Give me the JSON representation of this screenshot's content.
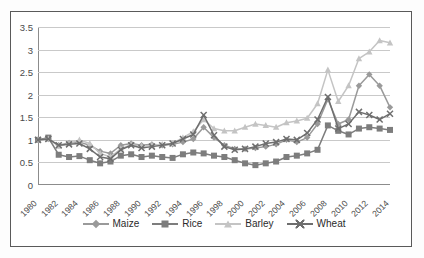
{
  "chart_data": {
    "type": "line",
    "title": "",
    "subtitle": "",
    "xlabel": "",
    "ylabel": "",
    "ylim": [
      0,
      3.5
    ],
    "xlim": [
      1980,
      2014
    ],
    "grid": true,
    "legend_position": "bottom",
    "y_ticks": [
      "0",
      "0.5",
      "1",
      "1.5",
      "2",
      "2.5",
      "3",
      "3.5"
    ],
    "y_tick_values": [
      0,
      0.5,
      1,
      1.5,
      2,
      2.5,
      3,
      3.5
    ],
    "x_tick_labels": [
      "1980",
      "1982",
      "1984",
      "1986",
      "1988",
      "1990",
      "1992",
      "1994",
      "1996",
      "1998",
      "2000",
      "2002",
      "2004",
      "2006",
      "2008",
      "2010",
      "2012",
      "2014"
    ],
    "x": [
      1980,
      1981,
      1982,
      1983,
      1984,
      1985,
      1986,
      1987,
      1988,
      1989,
      1990,
      1991,
      1992,
      1993,
      1994,
      1995,
      1996,
      1997,
      1998,
      1999,
      2000,
      2001,
      2002,
      2003,
      2004,
      2005,
      2006,
      2007,
      2008,
      2009,
      2010,
      2011,
      2012,
      2013,
      2014
    ],
    "series": [
      {
        "name": "Maize",
        "color": "#9a9a9a",
        "marker": "diamond",
        "values": [
          1.0,
          1.02,
          0.88,
          0.93,
          0.95,
          0.88,
          0.75,
          0.7,
          0.88,
          0.92,
          0.88,
          0.9,
          0.88,
          0.9,
          0.95,
          1.02,
          1.28,
          1.05,
          0.88,
          0.8,
          0.8,
          0.82,
          0.85,
          0.9,
          1.0,
          0.95,
          1.05,
          1.35,
          1.9,
          1.35,
          1.45,
          2.2,
          2.45,
          2.2,
          1.72
        ]
      },
      {
        "name": "Rice",
        "color": "#7d7d7d",
        "marker": "square",
        "values": [
          1.0,
          1.05,
          0.67,
          0.62,
          0.64,
          0.55,
          0.48,
          0.52,
          0.65,
          0.68,
          0.62,
          0.65,
          0.62,
          0.6,
          0.68,
          0.72,
          0.7,
          0.65,
          0.62,
          0.55,
          0.48,
          0.44,
          0.48,
          0.52,
          0.62,
          0.65,
          0.7,
          0.78,
          1.32,
          1.2,
          1.12,
          1.25,
          1.28,
          1.25,
          1.22
        ]
      },
      {
        "name": "Barley",
        "color": "#c4c4c4",
        "marker": "triangle",
        "values": [
          1.0,
          1.02,
          0.86,
          0.92,
          1.0,
          0.92,
          0.7,
          0.62,
          0.8,
          0.9,
          0.86,
          0.88,
          0.9,
          0.92,
          1.05,
          1.18,
          1.45,
          1.25,
          1.2,
          1.2,
          1.28,
          1.35,
          1.32,
          1.28,
          1.38,
          1.42,
          1.48,
          1.8,
          2.55,
          1.85,
          2.2,
          2.8,
          2.95,
          3.2,
          3.15
        ]
      },
      {
        "name": "Wheat",
        "color": "#6e6e6e",
        "marker": "x",
        "values": [
          1.0,
          1.02,
          0.88,
          0.9,
          0.92,
          0.8,
          0.62,
          0.58,
          0.78,
          0.88,
          0.82,
          0.85,
          0.88,
          0.92,
          1.02,
          1.12,
          1.55,
          1.1,
          0.85,
          0.78,
          0.8,
          0.85,
          0.92,
          0.95,
          1.02,
          1.0,
          1.15,
          1.45,
          1.95,
          1.25,
          1.35,
          1.62,
          1.55,
          1.45,
          1.58
        ]
      }
    ]
  },
  "legend": {
    "items": [
      {
        "label": "Maize"
      },
      {
        "label": "Rice"
      },
      {
        "label": "Barley"
      },
      {
        "label": "Wheat"
      }
    ]
  }
}
